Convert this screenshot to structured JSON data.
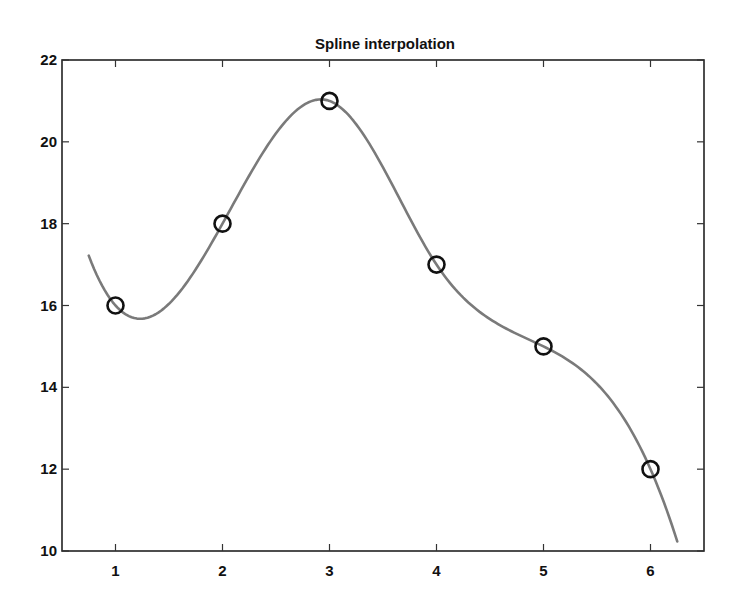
{
  "chart_data": {
    "type": "line",
    "title": "Spline interpolation",
    "xlabel": "",
    "ylabel": "",
    "xlim": [
      0.5,
      6.5
    ],
    "ylim": [
      10,
      22
    ],
    "xticks": [
      1,
      2,
      3,
      4,
      5,
      6
    ],
    "yticks": [
      10,
      12,
      14,
      16,
      18,
      20,
      22
    ],
    "grid": false,
    "legend": null,
    "series": [
      {
        "name": "data points",
        "style": "markers",
        "marker": "circle",
        "color": "#111111",
        "x": [
          1,
          2,
          3,
          4,
          5,
          6
        ],
        "y": [
          16,
          18,
          21,
          17,
          15,
          12
        ]
      },
      {
        "name": "spline interpolant",
        "style": "line",
        "color": "#7a7a7a",
        "x_range": [
          0.75,
          6.25
        ],
        "y_at_ends": [
          17.2,
          10.2
        ]
      }
    ]
  },
  "colors": {
    "background": "#ffffff",
    "axes": "#222222",
    "curve": "#7a7a7a",
    "markers": "#111111"
  }
}
